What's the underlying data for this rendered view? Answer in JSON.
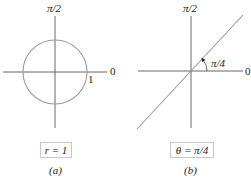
{
  "figure": {
    "panels": [
      {
        "id": "a",
        "axis_label_top": "π/2",
        "axis_label_right": "0",
        "radius_label": "1",
        "equation": "r = 1",
        "caption": "(a)",
        "shape": "circle",
        "circle_color": "#9a9a9a"
      },
      {
        "id": "b",
        "axis_label_top": "π/2",
        "axis_label_right": "0",
        "angle_label": "π/4",
        "equation": "θ = π/4",
        "caption": "(b)",
        "shape": "line-through-origin",
        "line_color": "#9a9a9a"
      }
    ],
    "colors": {
      "axis": "#444444",
      "curve": "#9a9a9a",
      "box_border": "#c8c8c8"
    }
  }
}
